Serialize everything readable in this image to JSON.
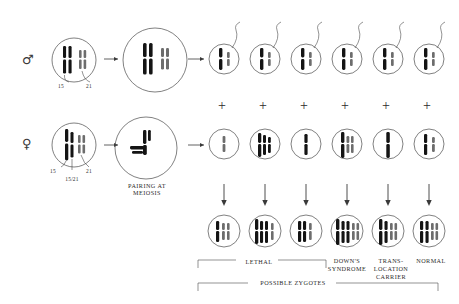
{
  "diagram": {
    "title_visible": false,
    "parents": [
      {
        "id": "father",
        "symbol": "♂",
        "symbol_name": "male-symbol",
        "chromosome_labels": [
          "15",
          "21"
        ],
        "translocation_label": "",
        "karyotype": "normal"
      },
      {
        "id": "mother",
        "symbol": "♀",
        "symbol_name": "female-symbol",
        "chromosome_labels": [
          "15",
          "21"
        ],
        "translocation_label": "15/21",
        "karyotype": "balanced-translocation-carrier"
      }
    ],
    "meiosis": {
      "caption_lines": [
        "PAIRING AT",
        "MEIOSIS"
      ],
      "father_pairing": "bivalent",
      "mother_pairing": "trivalent"
    },
    "gametes": {
      "sperm_row_label": "",
      "egg_row_label": "",
      "sperm_count": 6,
      "egg_count": 6,
      "operator": "+",
      "operator_count": 6,
      "sperm": [
        {
          "index": 1,
          "contents": "15 + 21"
        },
        {
          "index": 2,
          "contents": "15 + 21"
        },
        {
          "index": 3,
          "contents": "15 + 21"
        },
        {
          "index": 4,
          "contents": "15 + 21"
        },
        {
          "index": 5,
          "contents": "15 + 21"
        },
        {
          "index": 6,
          "contents": "15 + 21"
        }
      ],
      "eggs": [
        {
          "index": 1,
          "contents": "21"
        },
        {
          "index": 2,
          "contents": "15/21 + 15"
        },
        {
          "index": 3,
          "contents": "15"
        },
        {
          "index": 4,
          "contents": "15/21 + 21"
        },
        {
          "index": 5,
          "contents": "15/21"
        },
        {
          "index": 6,
          "contents": "15 + 21"
        }
      ]
    },
    "zygotes": {
      "count": 6,
      "items": [
        {
          "index": 1,
          "outcome_ref": "lethal"
        },
        {
          "index": 2,
          "outcome_ref": "lethal"
        },
        {
          "index": 3,
          "outcome_ref": "lethal"
        },
        {
          "index": 4,
          "outcome_ref": "downs"
        },
        {
          "index": 5,
          "outcome_ref": "carrier"
        },
        {
          "index": 6,
          "outcome_ref": "normal"
        }
      ]
    },
    "outcome_labels": {
      "lethal": "LETHAL",
      "downs_line1": "DOWN'S",
      "downs_line2": "SYNDROME",
      "carrier_line1": "TRANS-",
      "carrier_line2": "LOCATION",
      "carrier_line3": "CARRIER",
      "normal": "NORMAL"
    },
    "summary_bracket_label": "POSSIBLE ZYGOTES",
    "colors": {
      "ink": "#1a1a1a",
      "chromosome_dark": "#141414",
      "chromosome_light": "#6d6d6d",
      "outline": "#4a4a4a",
      "text": "#2a2a2a"
    }
  }
}
